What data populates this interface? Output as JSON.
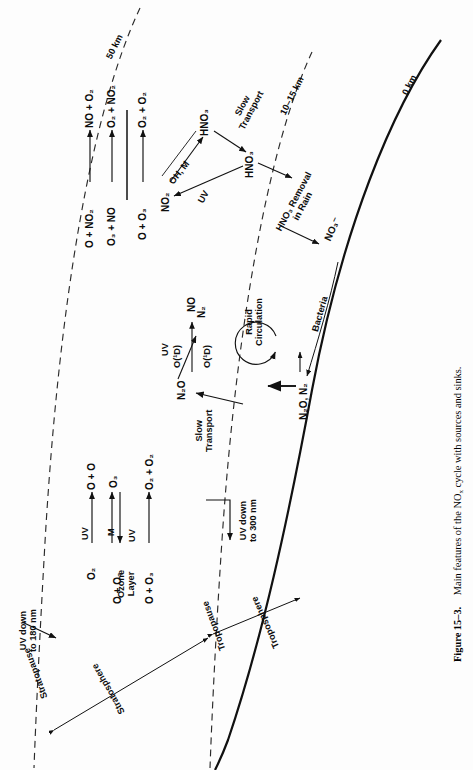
{
  "figure": {
    "number": "Figure 15–3.",
    "caption": "Main features of the NOx cycle with sources and sinks.",
    "caption_plain": "Figure 15–3.   Main features of the NOx cycle with sources and sinks."
  },
  "altitude_labels": [
    {
      "id": "alt-50",
      "text": "50 km"
    },
    {
      "id": "alt-10-15",
      "text": "10–15 km"
    },
    {
      "id": "alt-0",
      "text": "0 km"
    }
  ],
  "boundaries": [
    {
      "id": "stratopause",
      "text": "Stratopause",
      "style": "dashed"
    },
    {
      "id": "tropopause",
      "text": "Tropopause",
      "style": "dashed"
    },
    {
      "id": "ground",
      "text": "",
      "style": "solid"
    }
  ],
  "regions": [
    {
      "id": "stratosphere",
      "text": "Stratosphere"
    },
    {
      "id": "troposphere",
      "text": "Troposphere"
    },
    {
      "id": "ozone-layer",
      "text": "Ozone\nLayer",
      "line1": "Ozone",
      "line2": "Layer"
    }
  ],
  "uv_labels": [
    {
      "id": "uv-180",
      "line1": "UV down",
      "line2": "to 180 nm"
    },
    {
      "id": "uv-300",
      "line1": "UV down",
      "line2": "to 300 nm"
    }
  ],
  "nox_reactions": {
    "title": "NOx catalytic ozone destruction",
    "lines": [
      {
        "left": "O + NO₂",
        "arrow": "→",
        "right": "NO + O₂",
        "above": ""
      },
      {
        "left": "O₃ + NO",
        "arrow": "→",
        "right": "O₂ + NO₂",
        "above": ""
      },
      {
        "left": "O + O₃",
        "arrow": "→",
        "right": "O₂ + O₂",
        "above": "",
        "is_net": true
      }
    ]
  },
  "ozone_reactions": {
    "title": "Chapman ozone cycle",
    "lines": [
      {
        "left": "O₂",
        "arrow": "→",
        "right": "O + O",
        "above": "UV"
      },
      {
        "left": "O + O₂",
        "arrow": "⇄",
        "right": "O₃",
        "above": "M",
        "below": "UV"
      },
      {
        "left": "O + O₃",
        "arrow": "→",
        "right": "O₂ + O₂",
        "above": "",
        "is_net": true
      }
    ]
  },
  "species": [
    {
      "id": "no2-species",
      "text": "NO₂"
    },
    {
      "id": "hno3-strat",
      "text": "HNO₃"
    },
    {
      "id": "hno3-trop-boundary",
      "text": "HNO₃"
    },
    {
      "id": "n2o-strat",
      "text": "N₂O"
    },
    {
      "id": "n2-product",
      "text": "N₂"
    },
    {
      "id": "no-product",
      "text": "NO"
    },
    {
      "id": "nitrate-ion",
      "text": "NO₃⁻"
    },
    {
      "id": "n2o-n2-surface",
      "text": "N₂O, N₂"
    }
  ],
  "process_labels": [
    {
      "id": "oh-m",
      "text": "OH, M"
    },
    {
      "id": "uv-no2",
      "text": "UV"
    },
    {
      "id": "uv-n2o",
      "text": "UV"
    },
    {
      "id": "o1d-branch",
      "text": "O(¹D)"
    },
    {
      "id": "o1d-no",
      "text": "O(¹D)"
    },
    {
      "id": "slow-transport-hno3",
      "line1": "Slow",
      "line2": "Transport"
    },
    {
      "id": "slow-transport-n2o",
      "line1": "Slow",
      "line2": "Transport"
    },
    {
      "id": "hno3-rain",
      "line1": "HNO₃ Removal",
      "line2": "in Rain"
    },
    {
      "id": "rapid-circulation",
      "line1": "Rapid",
      "line2": "Circulation"
    },
    {
      "id": "bacteria",
      "text": "Bacteria"
    }
  ],
  "colors": {
    "ink": "#111111",
    "line": "#1a1a1a",
    "background": "#ffffff"
  }
}
